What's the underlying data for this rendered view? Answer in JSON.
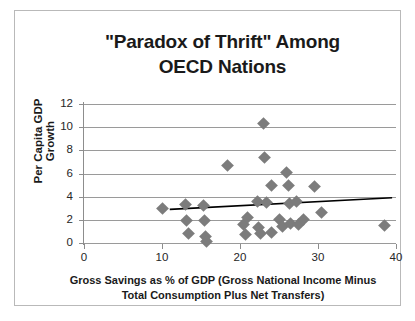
{
  "chart_data": {
    "type": "scatter",
    "title": "\"Paradox of Thrift\" Among OECD Nations",
    "title_line1": "\"Paradox of Thrift\" Among",
    "title_line2": "OECD Nations",
    "xlabel": "Gross Savings as % of GDP (Gross National Income Minus Total Consumption Plus Net Transfers)",
    "xlabel_line1": "Gross Savings as % of GDP (Gross National Income Minus",
    "xlabel_line2": "Total Consumption Plus Net Transfers)",
    "ylabel": "Per Capita GDP Growth",
    "xlim": [
      0,
      40
    ],
    "ylim": [
      0,
      12
    ],
    "xticks": [
      0,
      10,
      20,
      30,
      40
    ],
    "yticks": [
      0,
      2,
      4,
      6,
      8,
      10,
      12
    ],
    "grid": "horizontal",
    "legend": "none",
    "marker_color": "#7c7c7c",
    "marker_shape": "diamond",
    "trendline_color": "#000000",
    "gridline_color": "#9a9a9a",
    "points": [
      {
        "x": 10.1,
        "y": 3.0
      },
      {
        "x": 13.0,
        "y": 3.3
      },
      {
        "x": 13.1,
        "y": 1.9
      },
      {
        "x": 13.4,
        "y": 0.8
      },
      {
        "x": 15.3,
        "y": 3.2
      },
      {
        "x": 15.4,
        "y": 1.9
      },
      {
        "x": 15.6,
        "y": 0.6
      },
      {
        "x": 15.7,
        "y": 0.1
      },
      {
        "x": 18.4,
        "y": 6.7
      },
      {
        "x": 20.5,
        "y": 1.6
      },
      {
        "x": 20.7,
        "y": 0.7
      },
      {
        "x": 21.0,
        "y": 2.2
      },
      {
        "x": 22.3,
        "y": 3.6
      },
      {
        "x": 22.4,
        "y": 1.3
      },
      {
        "x": 22.6,
        "y": 0.8
      },
      {
        "x": 23.0,
        "y": 10.3
      },
      {
        "x": 23.1,
        "y": 7.4
      },
      {
        "x": 23.4,
        "y": 3.5
      },
      {
        "x": 24.0,
        "y": 5.0
      },
      {
        "x": 24.1,
        "y": 0.9
      },
      {
        "x": 25.1,
        "y": 2.0
      },
      {
        "x": 25.5,
        "y": 1.4
      },
      {
        "x": 26.0,
        "y": 6.1
      },
      {
        "x": 26.2,
        "y": 5.0
      },
      {
        "x": 26.4,
        "y": 3.4
      },
      {
        "x": 26.5,
        "y": 1.7
      },
      {
        "x": 27.3,
        "y": 3.6
      },
      {
        "x": 27.5,
        "y": 1.6
      },
      {
        "x": 28.2,
        "y": 2.0
      },
      {
        "x": 29.6,
        "y": 4.9
      },
      {
        "x": 30.5,
        "y": 2.6
      },
      {
        "x": 38.5,
        "y": 1.5
      }
    ],
    "trendline": {
      "x0": 11.0,
      "y0": 2.9,
      "x1": 39.5,
      "y1": 3.9
    }
  },
  "axis": {
    "y_ticks_labels": [
      "12",
      "10",
      "8",
      "6",
      "4",
      "2",
      "0"
    ],
    "x_ticks_labels": [
      "0",
      "10",
      "20",
      "30",
      "40"
    ]
  }
}
